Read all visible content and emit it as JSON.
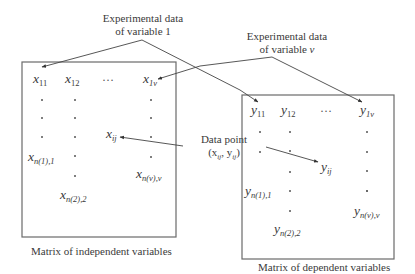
{
  "labels": {
    "exp_var1_line1": "Experimental data",
    "exp_var1_line2": "of variable 1",
    "exp_varv_line1": "Experimental data",
    "exp_varv_line2_prefix": "of variable ",
    "exp_varv_line2_var": "v",
    "data_point_line1": "Data point",
    "data_point_line2": "(x",
    "data_point_sub_x": "ij",
    "data_point_mid": ", y",
    "data_point_sub_y": "ij",
    "data_point_end": ")"
  },
  "captions": {
    "independent": "Matrix of independent variables",
    "dependent": "Matrix of dependent variables"
  },
  "independent_matrix": {
    "symbol": "x",
    "x11_sub": "11",
    "x12_sub": "12",
    "ellipsis": "…",
    "x1v_sub": "1v",
    "xij_sub": "ij",
    "xn1_sub": "n(1),1",
    "xn2_sub": "n(2),2",
    "xnv_sub": "n(v),v"
  },
  "dependent_matrix": {
    "symbol": "y",
    "y11_sub": "11",
    "y12_sub": "12",
    "ellipsis": "…",
    "y1v_sub": "1v",
    "yij_sub": "ij",
    "yn1_sub": "n(1),1",
    "yn2_sub": "n(2),2",
    "ynv_sub": "n(v),v"
  },
  "colors": {
    "stroke": "#555555",
    "text": "#3a3a3a",
    "box": "#6a6a6a"
  }
}
